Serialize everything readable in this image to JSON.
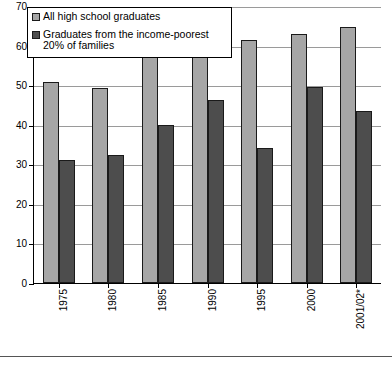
{
  "chart_data": {
    "type": "bar",
    "title": "",
    "xlabel": "",
    "ylabel": "",
    "ylim": [
      0,
      70
    ],
    "yticks": [
      0,
      10,
      20,
      30,
      40,
      50,
      60,
      70
    ],
    "grid": true,
    "legend_position": "top-left",
    "categories": [
      "1975",
      "1980",
      "1985",
      "1990",
      "1995",
      "2000",
      "2001/02*"
    ],
    "series": [
      {
        "name": "All high school graduates",
        "color": "#a6a6a6",
        "values": [
          50.8,
          49.3,
          57.6,
          59.8,
          61.5,
          63.0,
          64.7
        ]
      },
      {
        "name": "Graduates from the income-poorest 20% of families",
        "color": "#4d4d4d",
        "values": [
          31.2,
          32.3,
          40.0,
          46.3,
          34.0,
          49.5,
          43.4
        ]
      }
    ]
  },
  "legend": {
    "items": [
      {
        "label": "All high school graduates",
        "swatch": "series-a"
      },
      {
        "label": "Graduates from the income-poorest 20% of families",
        "swatch": "series-b"
      }
    ]
  },
  "footer": {
    "cutoff_text": ""
  }
}
